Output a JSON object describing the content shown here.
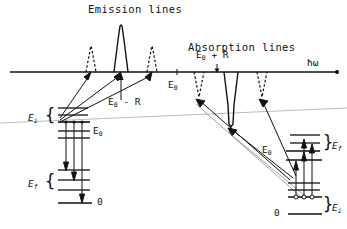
{
  "figure": {
    "type": "energy-level-and-spectrum-diagram",
    "titles": {
      "emission": "Emission lines",
      "absorption": "Absorption lines"
    },
    "axis": {
      "label": "ħω",
      "label_name": "hbar-omega",
      "y": 72,
      "x_start": 10,
      "x_end": 337
    },
    "axis_marks": [
      {
        "name": "E0-minus-R",
        "base": "E",
        "sub": "0",
        "tail": " - R",
        "x": 121,
        "y": 104
      },
      {
        "name": "E0-emission-center",
        "base": "E",
        "sub": "0",
        "tail": "",
        "x": 170,
        "y": 88
      },
      {
        "name": "E0-plus-R",
        "base": "E",
        "sub": "0",
        "tail": " + R",
        "x": 207,
        "y": 56
      }
    ],
    "spectrum": {
      "emission": {
        "direction": "up",
        "peaks": [
          {
            "name": "emission-sideband-left",
            "x": 91,
            "height": 26,
            "style": "dashed"
          },
          {
            "name": "emission-main",
            "x": 121,
            "height": 47,
            "style": "solid"
          },
          {
            "name": "emission-sideband-right",
            "x": 152,
            "height": 26,
            "style": "dashed"
          }
        ]
      },
      "absorption": {
        "direction": "down",
        "peaks": [
          {
            "name": "absorption-sideband-left",
            "x": 199,
            "depth": 26,
            "style": "dashed"
          },
          {
            "name": "absorption-main",
            "x": 231,
            "depth": 55,
            "style": "solid"
          },
          {
            "name": "absorption-sideband-right",
            "x": 262,
            "depth": 26,
            "style": "dashed"
          }
        ]
      }
    },
    "level_scheme_left": {
      "name": "emitter-level-scheme",
      "upper_group": {
        "label_base": "E",
        "label_sub": "i",
        "name": "Ei-bracket"
      },
      "upper_marker": {
        "text_base": "E",
        "text_sub": "0",
        "name": "E0-label-left"
      },
      "lower_group": {
        "label_base": "E",
        "label_sub": "f",
        "name": "Ef-bracket"
      },
      "ground_label": "0",
      "ground_label_name": "ground-level-zero-left"
    },
    "level_scheme_right": {
      "name": "absorber-level-scheme",
      "upper_group": {
        "label_base": "E",
        "label_sub": "f",
        "name": "Ef-bracket"
      },
      "upper_marker": {
        "text_base": "E",
        "text_sub": "0",
        "name": "E0-label-right"
      },
      "lower_group": {
        "label_base": "E",
        "label_sub": "i",
        "name": "Ei-bracket"
      },
      "ground_label": "0",
      "ground_label_name": "ground-level-zero-right"
    },
    "colors": {
      "ink": "#111111",
      "faint_line": "#9a9a9a",
      "background": "#ffffff"
    }
  }
}
